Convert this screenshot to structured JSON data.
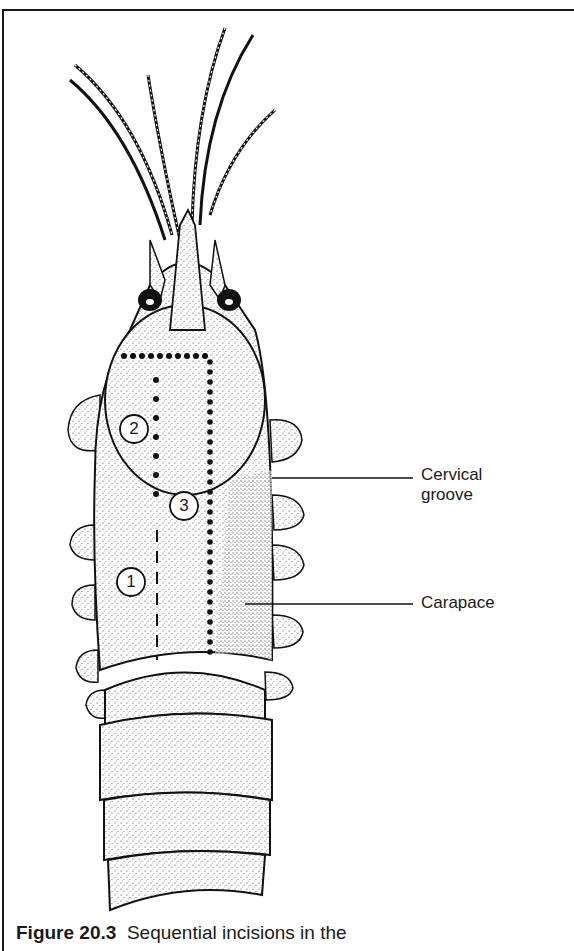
{
  "figure": {
    "labels": {
      "cervical_groove": [
        "Cervical",
        "groove"
      ],
      "carapace": "Carapace"
    },
    "incision_markers": [
      "1",
      "2",
      "3"
    ],
    "caption": {
      "number": "Figure 20.3",
      "text": "Sequential incisions in the"
    }
  },
  "colors": {
    "ink": "#1a1a1a",
    "paper": "#ffffff",
    "stipple": "#555555"
  }
}
